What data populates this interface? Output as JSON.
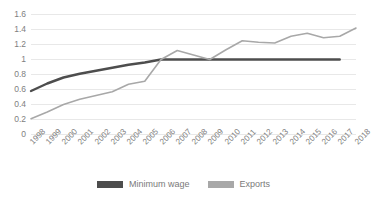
{
  "chart_data": {
    "type": "line",
    "title": "",
    "subtitle": "",
    "xlabel": "",
    "ylabel": "",
    "ylim": [
      0,
      1.6
    ],
    "y_ticks": [
      "0",
      "0.2",
      "0.4",
      "0.6",
      "0.8",
      "1",
      "1.2",
      "1.4",
      "1.6"
    ],
    "y_tick_values": [
      0,
      0.2,
      0.4,
      0.6,
      0.8,
      1,
      1.2,
      1.4,
      1.6
    ],
    "grid": "horizontal",
    "legend_position": "bottom",
    "categories": [
      "1998",
      "1999",
      "2000",
      "2001",
      "2002",
      "2003",
      "2004",
      "2005",
      "2006",
      "2007",
      "2008",
      "2009",
      "2010",
      "2011",
      "2012",
      "2013",
      "2014",
      "2015",
      "2016",
      "2017",
      "2018"
    ],
    "series": [
      {
        "name": "Minimum wage",
        "color": "#4d4d4d",
        "values": [
          0.58,
          0.68,
          0.76,
          0.81,
          0.85,
          0.89,
          0.93,
          0.96,
          1.0,
          1.0,
          1.0,
          1.0,
          1.0,
          1.0,
          1.0,
          1.0,
          1.0,
          1.0,
          1.0,
          1.0,
          null
        ]
      },
      {
        "name": "Exports",
        "color": "#a8a8a8",
        "values": [
          0.21,
          0.3,
          0.4,
          0.47,
          0.52,
          0.57,
          0.67,
          0.71,
          1.0,
          1.12,
          1.06,
          1.0,
          1.13,
          1.25,
          1.23,
          1.22,
          1.31,
          1.35,
          1.29,
          1.31,
          1.42
        ]
      }
    ]
  },
  "legend": {
    "items": [
      {
        "label": "Minimum wage",
        "color": "#4d4d4d"
      },
      {
        "label": "Exports",
        "color": "#a8a8a8"
      }
    ]
  },
  "colors": {
    "background": "#ffffff",
    "gridline": "#e8e8e8",
    "axis_text": "#808080",
    "minimum_wage": "#4d4d4d",
    "exports": "#a8a8a8"
  }
}
